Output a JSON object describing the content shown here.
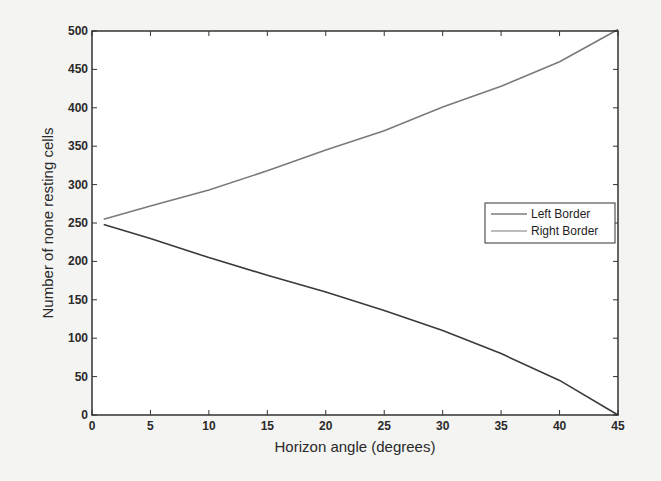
{
  "chart_data": {
    "type": "line",
    "title": "",
    "xlabel": "Horizon angle (degrees)",
    "ylabel": "Number of none resting cells",
    "xlim": [
      0,
      45
    ],
    "ylim": [
      0,
      500
    ],
    "xticks": [
      0,
      5,
      10,
      15,
      20,
      25,
      30,
      35,
      40,
      45
    ],
    "yticks": [
      0,
      50,
      100,
      150,
      200,
      250,
      300,
      350,
      400,
      450,
      500
    ],
    "grid": false,
    "legend_position": "east",
    "x": [
      1,
      5,
      10,
      15,
      20,
      25,
      30,
      35,
      40,
      45
    ],
    "series": [
      {
        "name": "Left Border",
        "color": "#3a3a3a",
        "values": [
          248,
          230,
          205,
          182,
          160,
          136,
          110,
          80,
          45,
          0
        ]
      },
      {
        "name": "Right Border",
        "color": "#7a7a7a",
        "values": [
          255,
          272,
          293,
          318,
          345,
          370,
          401,
          428,
          460,
          502
        ]
      }
    ]
  },
  "legend": {
    "items": [
      {
        "label": "Left Border",
        "color": "#3a3a3a"
      },
      {
        "label": "Right Border",
        "color": "#7a7a7a"
      }
    ]
  }
}
